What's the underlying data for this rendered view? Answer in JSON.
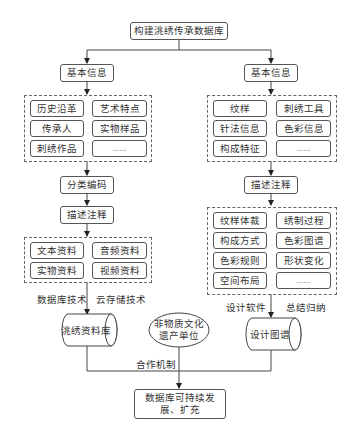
{
  "root": {
    "label": "构建洮绣传承数据库"
  },
  "left": {
    "basic_info": "基本信息",
    "items": [
      "历史沿革",
      "艺术特点",
      "传承人",
      "实物样品",
      "刺绣作品",
      "……"
    ],
    "classify": "分类编码",
    "describe": "描述注释",
    "materials": [
      "文本资料",
      "音频资料",
      "实物资料",
      "视频资料"
    ],
    "tech_label_1": "数据库技术",
    "tech_label_2": "云存储技术",
    "database": "洮绣资料库"
  },
  "right": {
    "basic_info": "基本信息",
    "items": [
      "纹样",
      "刺绣工具",
      "针法信息",
      "色彩信息",
      "构成特征",
      "……"
    ],
    "describe": "描述注释",
    "details": [
      "纹样体裁",
      "绣制过程",
      "构成方式",
      "色彩图谱",
      "色彩规则",
      "形状变化",
      "空间布局",
      "……"
    ],
    "label_1": "设计软件",
    "label_2": "总结归纳",
    "database": "设计图谱"
  },
  "center": {
    "unit_line1": "非物质文化",
    "unit_line2": "遗产单位",
    "coop_label": "合作机制",
    "final_line1": "数据库可持续发",
    "final_line2": "展、扩充"
  }
}
